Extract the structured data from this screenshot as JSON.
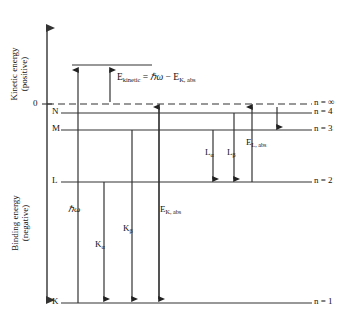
{
  "figure": {
    "type": "energy-level-diagram",
    "title_visible": false,
    "background": "#ffffff",
    "line_color": "#333333",
    "text_color": "#111111"
  },
  "axis": {
    "upper_label_line1": "Kinetic energy",
    "upper_label_line2": "(positive)",
    "lower_label_line1": "Binding energy",
    "lower_label_line2": "(negative)",
    "zero_tick": "0"
  },
  "shells": [
    {
      "letter": "N",
      "n_label": "n = ∞",
      "kind": "continuum",
      "dashed": true
    },
    {
      "letter": "N",
      "n_label": "n = 4",
      "kind": "level"
    },
    {
      "letter": "M",
      "n_label": "n = 3",
      "kind": "level"
    },
    {
      "letter": "L",
      "n_label": "n = 2",
      "kind": "level"
    },
    {
      "letter": "K",
      "n_label": "n = 1",
      "kind": "level"
    }
  ],
  "left_shell_labels": {
    "n": "N",
    "m": "M",
    "l": "L",
    "k": "K"
  },
  "right_labels": {
    "n_infinity": "n = ∞",
    "n_four": "n = 4",
    "n_three": "n = 3",
    "n_two": "n = 2",
    "n_one": "n = 1"
  },
  "equation": {
    "lhs": "E",
    "lhs_sub": "kinetic",
    "equals": " = ",
    "photon": "ℏω",
    "minus": " − ",
    "rhs": "E",
    "rhs_sub": "K, abs",
    "full_text": "E kinetic = ℏω − E K, abs"
  },
  "transitions": [
    {
      "id": "hw",
      "label_main": "ℏω",
      "label_sub": "",
      "italic": true,
      "direction": "up",
      "from": "K",
      "to": "above-zero"
    },
    {
      "id": "k-alpha",
      "label_main": "K",
      "label_sub": "α",
      "italic": false,
      "direction": "down",
      "from": "L",
      "to": "K"
    },
    {
      "id": "k-beta",
      "label_main": "K",
      "label_sub": "β",
      "italic": false,
      "direction": "down",
      "from": "M",
      "to": "K"
    },
    {
      "id": "ek-abs",
      "label_main": "E",
      "label_sub": "K, abs",
      "italic": false,
      "direction": "down",
      "from": "continuum",
      "to": "K"
    },
    {
      "id": "l-alpha",
      "label_main": "L",
      "label_sub": "α",
      "italic": false,
      "direction": "down",
      "from": "M",
      "to": "L"
    },
    {
      "id": "l-beta",
      "label_main": "L",
      "label_sub": "β",
      "italic": false,
      "direction": "down",
      "from": "N",
      "to": "L"
    },
    {
      "id": "el-abs",
      "label_main": "E",
      "label_sub": "L, abs",
      "italic": false,
      "direction": "up",
      "from": "L",
      "to": "continuum"
    },
    {
      "id": "kinetic",
      "label_main": "",
      "label_sub": "",
      "italic": false,
      "direction": "up",
      "from": "continuum",
      "to": "above-zero"
    },
    {
      "id": "n-to-m",
      "label_main": "",
      "label_sub": "",
      "italic": false,
      "direction": "down",
      "from": "continuum",
      "to": "M"
    }
  ],
  "transition_labels": {
    "hw": "ℏω",
    "k_alpha_main": "K",
    "k_alpha_sub": "α",
    "k_beta_main": "K",
    "k_beta_sub": "β",
    "ek_abs_main": "E",
    "ek_abs_sub": "K, abs",
    "l_alpha_main": "L",
    "l_alpha_sub": "α",
    "l_beta_main": "L",
    "l_beta_sub": "β",
    "el_abs_main": "E",
    "el_abs_sub": "L, abs"
  }
}
